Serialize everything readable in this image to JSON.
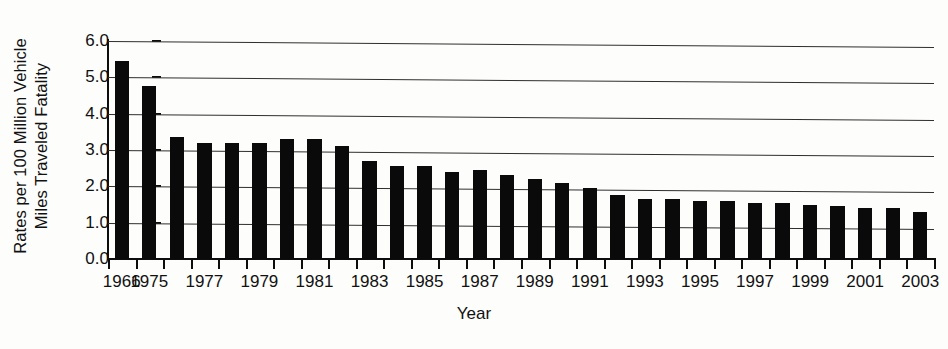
{
  "chart_data": {
    "type": "bar",
    "title": "",
    "xlabel": "Year",
    "ylabel_lines": [
      "Rates per 100 Million Vehicle",
      "Miles Traveled  Fatality"
    ],
    "ylabel": "Fatality Rates per 100 Million Vehicle Miles Traveled",
    "ylim": [
      0.0,
      6.0
    ],
    "ytick_labels": [
      "6.0",
      "5.0",
      "4.0",
      "3.0",
      "2.0",
      "1.0",
      "0.0"
    ],
    "ytick_values": [
      6.0,
      5.0,
      4.0,
      3.0,
      2.0,
      1.0,
      0.0
    ],
    "grid": true,
    "legend": null,
    "categories": [
      "1966",
      "1975",
      "1976",
      "1977",
      "1978",
      "1979",
      "1980",
      "1981",
      "1982",
      "1983",
      "1984",
      "1985",
      "1986",
      "1987",
      "1988",
      "1989",
      "1990",
      "1991",
      "1992",
      "1993",
      "1994",
      "1995",
      "1996",
      "1997",
      "1998",
      "1999",
      "2000",
      "2001",
      "2002",
      "2003"
    ],
    "values": [
      5.45,
      4.75,
      3.35,
      3.2,
      3.2,
      3.2,
      3.3,
      3.3,
      3.1,
      2.7,
      2.55,
      2.55,
      2.4,
      2.45,
      2.3,
      2.2,
      2.1,
      1.95,
      1.75,
      1.65,
      1.65,
      1.6,
      1.6,
      1.55,
      1.55,
      1.5,
      1.45,
      1.4,
      1.4,
      1.3
    ],
    "xtick_labels": [
      "1966",
      "1975",
      "1977",
      "1979",
      "1981",
      "1983",
      "1985",
      "1987",
      "1989",
      "1991",
      "1993",
      "1995",
      "1997",
      "1999",
      "2001",
      "2003"
    ],
    "xtick_label_indices": [
      0,
      1,
      3,
      5,
      7,
      9,
      11,
      13,
      15,
      17,
      19,
      21,
      23,
      25,
      27,
      29
    ],
    "bar_color": "#0a0a0a",
    "axis_color": "#0d0d0d",
    "grid_color": "#2e2e2e",
    "background": "#fdfdfc"
  }
}
